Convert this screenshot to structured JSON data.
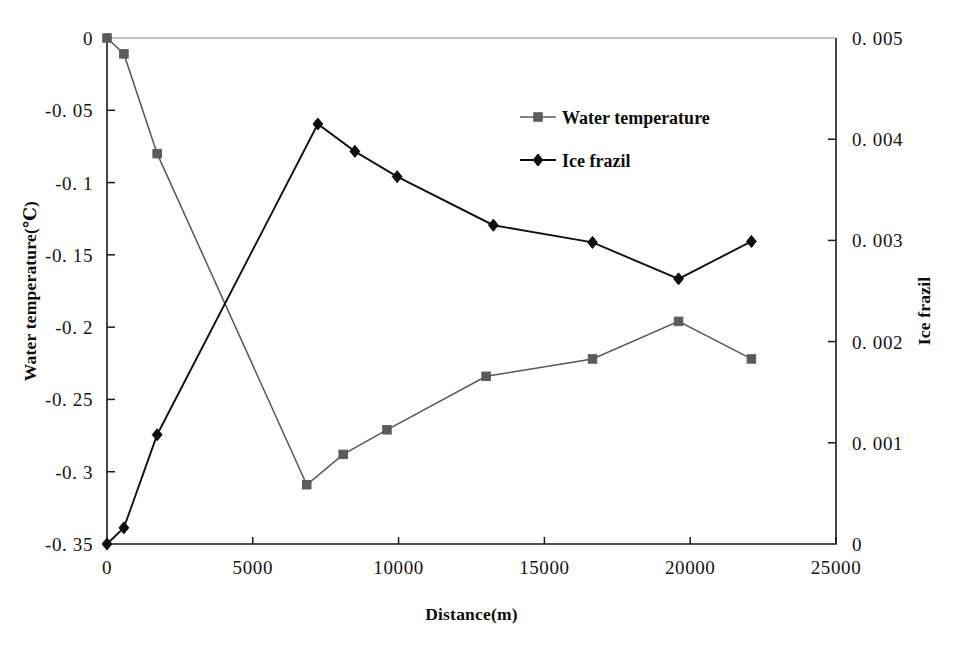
{
  "chart_data": {
    "type": "line",
    "title": "",
    "xlabel": "Distance(m)",
    "ylabel": "Water temperature(℃)",
    "y2label": "Ice frazil",
    "xlim": [
      0,
      25000
    ],
    "ylim": [
      -0.35,
      0
    ],
    "y2lim": [
      0,
      0.005
    ],
    "grid": false,
    "legend_position": "upper-center-right",
    "xticks": [
      "0",
      "5000",
      "10000",
      "15000",
      "20000",
      "25000"
    ],
    "xtick_values": [
      0,
      5000,
      10000,
      15000,
      20000,
      25000
    ],
    "yticks": [
      "0",
      "-0. 05",
      "-0. 1",
      "-0. 15",
      "-0. 2",
      "-0. 25",
      "-0. 3",
      "-0. 35"
    ],
    "ytick_values": [
      0,
      -0.05,
      -0.1,
      -0.15,
      -0.2,
      -0.25,
      -0.3,
      -0.35
    ],
    "y2ticks": [
      "0. 005",
      "0. 004",
      "0. 003",
      "0. 002",
      "0. 001",
      "0"
    ],
    "y2tick_values": [
      0.005,
      0.004,
      0.003,
      0.002,
      0.001,
      0
    ],
    "series": [
      {
        "name": "Water temperature",
        "axis": "left",
        "marker": "square",
        "color": "#5b5b5b",
        "x": [
          0,
          580,
          1720,
          6850,
          8100,
          9600,
          13000,
          16650,
          19600,
          22100
        ],
        "values": [
          0,
          -0.011,
          -0.08,
          -0.309,
          -0.288,
          -0.271,
          -0.234,
          -0.222,
          -0.196,
          -0.222
        ]
      },
      {
        "name": "Ice frazil",
        "axis": "right",
        "marker": "diamond",
        "color": "#0d0d0d",
        "x": [
          0,
          580,
          1720,
          7230,
          8500,
          9950,
          13250,
          16650,
          19600,
          22100
        ],
        "values": [
          0.0,
          0.00016,
          0.00108,
          0.00415,
          0.00388,
          0.00363,
          0.00315,
          0.00298,
          0.00262,
          0.00299
        ]
      }
    ],
    "legend": [
      {
        "label": "Water temperature",
        "marker": "square",
        "color": "#5b5b5b"
      },
      {
        "label": "Ice frazil",
        "marker": "diamond",
        "color": "#0d0d0d"
      }
    ]
  }
}
